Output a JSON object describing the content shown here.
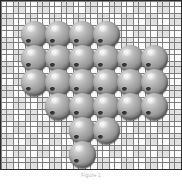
{
  "board": {
    "name": "marble-game-board",
    "width": 182,
    "height": 170,
    "border_color": "#2b2b2b",
    "background_color": "#f4f4f4",
    "texture": "basket-weave",
    "texture_light": "#fbfbfb",
    "texture_dark": "#e2e2e2",
    "texture_line": "#787878",
    "grid": {
      "columns": 6,
      "rows": 6,
      "cell_size": 24,
      "origin_x": 20,
      "origin_y": 20
    }
  },
  "piece_style": {
    "shape": "sphere",
    "diameter": 27,
    "color_light": "#e8e8e8",
    "color_mid": "#9b9b9b",
    "color_dark": "#4a4a4a",
    "highlight_color": "#ffffff",
    "notch_color": "#1d1d1d"
  },
  "pieces": [
    {
      "id": "piece-r1c1",
      "row": 1,
      "col": 1,
      "x": 20,
      "y": 20
    },
    {
      "id": "piece-r1c2",
      "row": 1,
      "col": 2,
      "x": 44,
      "y": 20
    },
    {
      "id": "piece-r1c3",
      "row": 1,
      "col": 3,
      "x": 68,
      "y": 20
    },
    {
      "id": "piece-r1c4",
      "row": 1,
      "col": 4,
      "x": 92,
      "y": 20
    },
    {
      "id": "piece-r2c1",
      "row": 2,
      "col": 1,
      "x": 20,
      "y": 44
    },
    {
      "id": "piece-r2c2",
      "row": 2,
      "col": 2,
      "x": 44,
      "y": 44
    },
    {
      "id": "piece-r2c3",
      "row": 2,
      "col": 3,
      "x": 68,
      "y": 44
    },
    {
      "id": "piece-r2c4",
      "row": 2,
      "col": 4,
      "x": 92,
      "y": 44
    },
    {
      "id": "piece-r2c5",
      "row": 2,
      "col": 5,
      "x": 116,
      "y": 44
    },
    {
      "id": "piece-r2c6",
      "row": 2,
      "col": 6,
      "x": 140,
      "y": 44
    },
    {
      "id": "piece-r3c1",
      "row": 3,
      "col": 1,
      "x": 20,
      "y": 68
    },
    {
      "id": "piece-r3c2",
      "row": 3,
      "col": 2,
      "x": 44,
      "y": 68
    },
    {
      "id": "piece-r3c3",
      "row": 3,
      "col": 3,
      "x": 68,
      "y": 68
    },
    {
      "id": "piece-r3c4",
      "row": 3,
      "col": 4,
      "x": 92,
      "y": 68
    },
    {
      "id": "piece-r3c5",
      "row": 3,
      "col": 5,
      "x": 116,
      "y": 68
    },
    {
      "id": "piece-r3c6",
      "row": 3,
      "col": 6,
      "x": 140,
      "y": 68
    },
    {
      "id": "piece-r4c2",
      "row": 4,
      "col": 2,
      "x": 44,
      "y": 92
    },
    {
      "id": "piece-r4c3",
      "row": 4,
      "col": 3,
      "x": 68,
      "y": 92
    },
    {
      "id": "piece-r4c4",
      "row": 4,
      "col": 4,
      "x": 92,
      "y": 92
    },
    {
      "id": "piece-r4c5",
      "row": 4,
      "col": 5,
      "x": 116,
      "y": 92
    },
    {
      "id": "piece-r4c6",
      "row": 4,
      "col": 6,
      "x": 140,
      "y": 92
    },
    {
      "id": "piece-r5c3",
      "row": 5,
      "col": 3,
      "x": 68,
      "y": 116
    },
    {
      "id": "piece-r5c4",
      "row": 5,
      "col": 4,
      "x": 92,
      "y": 116
    },
    {
      "id": "piece-r6c3",
      "row": 6,
      "col": 3,
      "x": 68,
      "y": 140
    }
  ],
  "caption": {
    "text": "Figure 1"
  }
}
